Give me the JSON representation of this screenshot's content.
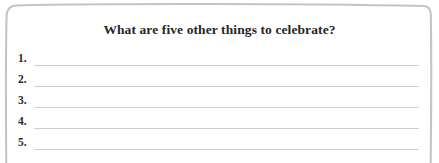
{
  "card": {
    "title": "What are five other things to celebrate?",
    "border_color": "#c8c8c8",
    "background_color": "#ffffff",
    "text_color": "#262626",
    "rule_color": "#cfcfcf"
  },
  "answers": [
    {
      "number": "1.",
      "value": ""
    },
    {
      "number": "2.",
      "value": ""
    },
    {
      "number": "3.",
      "value": ""
    },
    {
      "number": "4.",
      "value": ""
    },
    {
      "number": "5.",
      "value": ""
    }
  ]
}
